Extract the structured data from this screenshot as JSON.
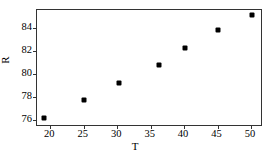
{
  "chart_data": {
    "type": "scatter",
    "title": "",
    "xlabel": "T",
    "ylabel": "R",
    "xlim": [
      18.0,
      51.5
    ],
    "ylim": [
      75.6,
      85.6
    ],
    "grid": false,
    "legend": null,
    "marker_color": "#000000",
    "frame_color": "#333333",
    "background": "#ffffff",
    "xticks": [
      20,
      25,
      30,
      35,
      40,
      45,
      50
    ],
    "yticks": [
      76,
      78,
      80,
      82,
      84
    ],
    "xtick_labels": [
      "20",
      "25",
      "30",
      "35",
      "40",
      "45",
      "50"
    ],
    "ytick_labels": [
      "76",
      "78",
      "80",
      "82",
      "84"
    ],
    "points": [
      {
        "x": 19.0,
        "y": 76.2
      },
      {
        "x": 25.1,
        "y": 77.8
      },
      {
        "x": 30.3,
        "y": 79.25
      },
      {
        "x": 36.3,
        "y": 80.8
      },
      {
        "x": 40.1,
        "y": 82.3
      },
      {
        "x": 45.1,
        "y": 83.9
      },
      {
        "x": 50.1,
        "y": 85.2
      }
    ]
  }
}
